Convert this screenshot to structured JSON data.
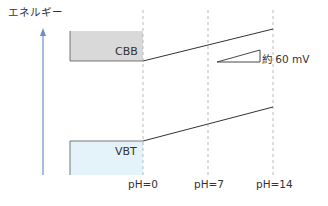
{
  "diagram": {
    "y_axis_label": "エネルギー",
    "bands": [
      {
        "name": "CBB",
        "label": "CBB",
        "fill": "#d9d9d9"
      },
      {
        "name": "VBT",
        "label": "VBT",
        "fill": "#e4f3f9"
      }
    ],
    "ph_labels": [
      "pH=0",
      "pH=7",
      "pH=14"
    ],
    "annotation": "約 60 mV",
    "colors": {
      "axis_arrow": "#6a8fc8",
      "dashed_lines": "#aaaaaa",
      "band_lines": "#333333"
    }
  }
}
